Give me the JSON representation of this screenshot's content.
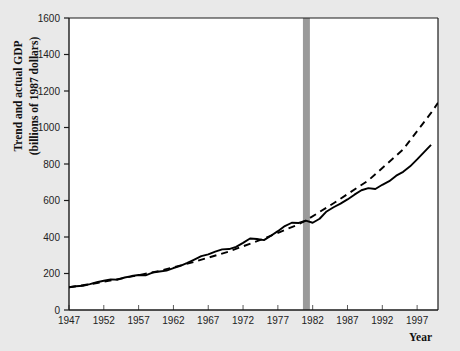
{
  "chart_data": {
    "type": "line",
    "title": "",
    "xlabel": "Year",
    "ylabel": "Trend and actual GDP (billions of 1987 dollars)",
    "ylabel_line1": "Trend and actual GDP",
    "ylabel_line2": "(billions of 1987 dollars)",
    "xlim": [
      1947,
      2000
    ],
    "ylim": [
      0,
      1600
    ],
    "grid": false,
    "legend": "none",
    "xticks": [
      1947,
      1952,
      1957,
      1962,
      1967,
      1972,
      1977,
      1982,
      1987,
      1992,
      1997
    ],
    "xtick_labels": [
      "1947",
      "1952",
      "1957",
      "1962",
      "1967",
      "1972",
      "1977",
      "1982",
      "1987",
      "1992",
      "1997"
    ],
    "yticks": [
      0,
      200,
      400,
      600,
      800,
      1000,
      1200,
      1400,
      1600
    ],
    "ytick_labels": [
      "0",
      "200",
      "400",
      "600",
      "800",
      "1000",
      "1200",
      "1400",
      "1600"
    ],
    "annotations": [
      {
        "name": "break-band",
        "type": "vertical-band",
        "x_start": 1980.6,
        "x_end": 1981.6,
        "color": "#9a9a9a",
        "label": ""
      }
    ],
    "series": [
      {
        "name": "Actual GDP",
        "style": "solid",
        "color": "#000000",
        "x": [
          1947,
          1948,
          1949,
          1950,
          1951,
          1952,
          1953,
          1954,
          1955,
          1956,
          1957,
          1958,
          1959,
          1960,
          1961,
          1962,
          1963,
          1964,
          1965,
          1966,
          1967,
          1968,
          1969,
          1970,
          1971,
          1972,
          1973,
          1974,
          1975,
          1976,
          1977,
          1978,
          1979,
          1980,
          1981,
          1982,
          1983,
          1984,
          1985,
          1986,
          1987,
          1988,
          1989,
          1990,
          1991,
          1992,
          1993,
          1994,
          1995,
          1996,
          1997,
          1998,
          1999
        ],
        "values": [
          125,
          130,
          133,
          142,
          152,
          160,
          168,
          166,
          178,
          186,
          192,
          190,
          205,
          211,
          216,
          230,
          242,
          258,
          276,
          295,
          305,
          320,
          332,
          334,
          346,
          368,
          392,
          389,
          383,
          407,
          432,
          460,
          478,
          477,
          490,
          478,
          500,
          540,
          563,
          583,
          606,
          632,
          656,
          668,
          663,
          686,
          706,
          736,
          757,
          787,
          825,
          865,
          905
        ]
      },
      {
        "name": "Trend GDP",
        "style": "dashed",
        "color": "#000000",
        "x": [
          1947,
          1950,
          1955,
          1960,
          1965,
          1970,
          1975,
          1980,
          1981,
          1985,
          1990,
          1995,
          1999,
          2000
        ],
        "values": [
          125,
          141,
          176,
          214,
          264,
          321,
          391,
          470,
          490,
          585,
          710,
          880,
          1080,
          1135
        ]
      }
    ]
  },
  "plot": {
    "background": "#ffffff",
    "page_background": "#e9e9e9",
    "axis_color": "#1a1a1a"
  }
}
